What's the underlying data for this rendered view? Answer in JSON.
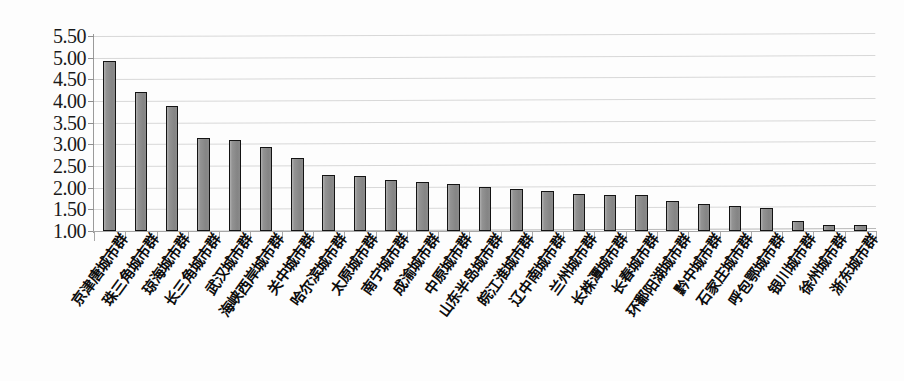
{
  "chart_data": {
    "type": "bar",
    "title": "",
    "subtitle": "",
    "xlabel": "",
    "ylabel": "",
    "ylim": [
      1.0,
      5.5
    ],
    "ytick_labels": [
      "5.50",
      "5.00",
      "4.50",
      "4.00",
      "3.50",
      "3.00",
      "2.50",
      "2.00",
      "1.50",
      "1.00"
    ],
    "ytick_values": [
      5.5,
      5.0,
      4.5,
      4.0,
      3.5,
      3.0,
      2.5,
      2.0,
      1.5,
      1.0
    ],
    "grid": true,
    "grid_axis": "y",
    "legend": false,
    "legend_position": "none",
    "bar_fill_color": "#8d8d8d",
    "bar_border_color": "#141414",
    "gridline_color": "#d8d8d8",
    "categories": [
      "京津唐城市群",
      "珠三角城市群",
      "琼海城市群",
      "长三角城市群",
      "武汉城市群",
      "海峡西岸城市群",
      "关中城市群",
      "哈尔滨城市群",
      "太原城市群",
      "南宁城市群",
      "成渝城市群",
      "中原城市群",
      "山东半岛城市群",
      "皖江淮城市群",
      "辽中南城市群",
      "兰州城市群",
      "长株潭城市群",
      "长春城市群",
      "环鄱阳湖城市群",
      "黔中城市群",
      "石家庄城市群",
      "呼包鄂城市群",
      "银川城市群",
      "徐州城市群",
      "浙东城市群"
    ],
    "values": [
      4.92,
      4.2,
      3.88,
      3.15,
      3.1,
      2.95,
      2.68,
      2.3,
      2.26,
      2.18,
      2.14,
      2.08,
      2.02,
      1.97,
      1.92,
      1.86,
      1.84,
      1.83,
      1.7,
      1.62,
      1.57,
      1.52,
      1.22,
      1.15,
      1.15
    ]
  }
}
